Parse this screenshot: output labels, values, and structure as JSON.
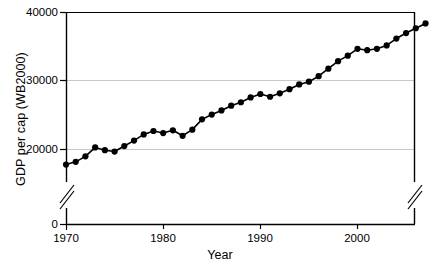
{
  "chart_data": {
    "type": "line",
    "title": "",
    "xlabel": "Year",
    "ylabel": "GDP per cap (WB2000)",
    "xlim": [
      1969.2,
      2007.6
    ],
    "ylim": [
      0,
      40000
    ],
    "y_axis_break": true,
    "y_break_range": [
      1000,
      16500
    ],
    "grid": "horizontal",
    "legend": "none",
    "marker": "filled-circle",
    "line_color": "#000000",
    "marker_color": "#000000",
    "grid_color": "#c8c8c8",
    "axis_color": "#000000",
    "yticks": [
      0,
      20000,
      30000,
      40000
    ],
    "ytick_labels": [
      "0",
      "20000",
      "30000",
      "40000"
    ],
    "xticks": [
      1970,
      1980,
      1990,
      2000
    ],
    "xtick_labels": [
      "1970",
      "1980",
      "1990",
      "2000"
    ],
    "x": [
      1970,
      1971,
      1972,
      1973,
      1974,
      1975,
      1976,
      1977,
      1978,
      1979,
      1980,
      1981,
      1982,
      1983,
      1984,
      1985,
      1986,
      1987,
      1988,
      1989,
      1990,
      1991,
      1992,
      1993,
      1994,
      1995,
      1996,
      1997,
      1998,
      1999,
      2000,
      2001,
      2002,
      2003,
      2004,
      2005,
      2006,
      2007
    ],
    "values": [
      17800,
      18200,
      19000,
      20300,
      19900,
      19700,
      20500,
      21300,
      22200,
      22700,
      22400,
      22800,
      22000,
      22900,
      24400,
      25100,
      25700,
      26400,
      26900,
      27600,
      28100,
      27700,
      28200,
      28800,
      29500,
      29900,
      30700,
      31800,
      32900,
      33700,
      34700,
      34500,
      34700,
      35200,
      36200,
      37000,
      37700,
      38400
    ],
    "series_name": "GDP per cap"
  }
}
